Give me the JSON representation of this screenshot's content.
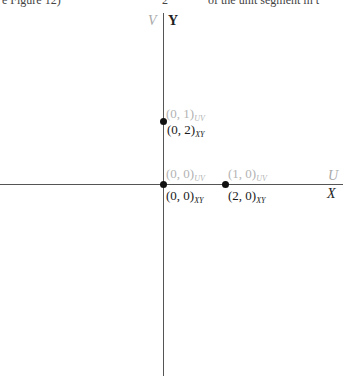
{
  "header_fragments": {
    "left": "e Figure 12)",
    "middle": "2",
    "right": "of the unit segment in t"
  },
  "axes": {
    "horizontal": {
      "uv_name": "U",
      "xy_name": "X"
    },
    "vertical": {
      "uv_name": "V",
      "xy_name": "Y"
    }
  },
  "points": [
    {
      "uv": "(0, 1)",
      "uv_sub": "UV",
      "xy": "(0, 2)",
      "xy_sub": "XY"
    },
    {
      "uv": "(0, 0)",
      "uv_sub": "UV",
      "xy": "(0, 0)",
      "xy_sub": "XY"
    },
    {
      "uv": "(1, 0)",
      "uv_sub": "UV",
      "xy": "(2, 0)",
      "xy_sub": "XY"
    }
  ],
  "colors": {
    "uv_label": "#b3b3b3",
    "xy_label": "#1a1a1a",
    "axis": "#555555",
    "point": "#111111"
  }
}
